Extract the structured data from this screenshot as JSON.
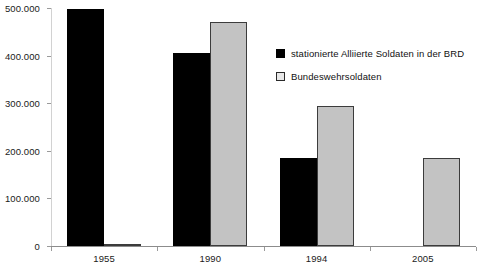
{
  "chart_data": {
    "type": "bar",
    "title": "",
    "subtitle": "",
    "xlabel": "",
    "ylabel": "",
    "categories": [
      "1955",
      "1990",
      "1994",
      "2005"
    ],
    "series": [
      {
        "name": "stationierte Alliierte Soldaten in der BRD",
        "color": "#000000",
        "values": [
          497000,
          405000,
          185000,
          0
        ]
      },
      {
        "name": "Bundeswehrsoldaten",
        "color": "#C3C3C3",
        "values": [
          5000,
          470000,
          295000,
          185000
        ]
      }
    ],
    "ylim": [
      0,
      500000
    ],
    "ytick_values": [
      0,
      100000,
      200000,
      300000,
      400000,
      500000
    ],
    "ytick_labels": [
      "0",
      "100.000",
      "200.000",
      "300.000",
      "400.000",
      "500.000"
    ],
    "grid": false,
    "legend_position": "upper-right",
    "number_format": "de-DE"
  },
  "legend": {
    "items": [
      {
        "label": "stationierte Alliierte Soldaten in der BRD",
        "swatch": "filled-black-square"
      },
      {
        "label": "Bundeswehrsoldaten",
        "swatch": "outlined-gray-square"
      }
    ]
  }
}
